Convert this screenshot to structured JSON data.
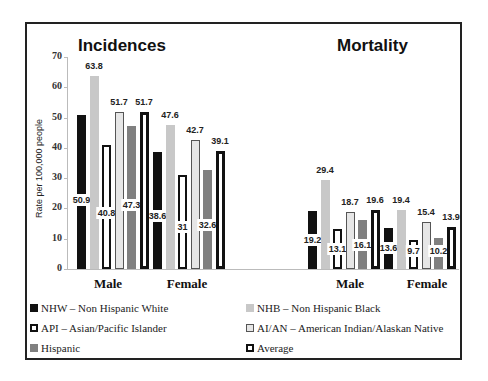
{
  "chart_data": [
    {
      "type": "bar",
      "title": "Incidences",
      "categories": [
        "Male",
        "Female"
      ],
      "series": [
        {
          "name": "NHW – Non Hispanic White",
          "values": [
            50.9,
            38.6
          ]
        },
        {
          "name": "NHB – Non Hispanic Black",
          "values": [
            63.8,
            47.6
          ]
        },
        {
          "name": "API – Asian/Pacific Islander",
          "values": [
            40.8,
            31
          ]
        },
        {
          "name": "AI/AN – American Indian/Alaskan Native",
          "values": [
            51.7,
            42.7
          ]
        },
        {
          "name": "Hispanic",
          "values": [
            47.3,
            32.6
          ]
        },
        {
          "name": "Average",
          "values": [
            51.7,
            39.1
          ]
        }
      ],
      "ylabel": "Rate per 100,000 people",
      "ylim": [
        0,
        70
      ],
      "yticks": [
        0,
        10,
        20,
        30,
        40,
        50,
        60,
        70
      ],
      "grid": false
    },
    {
      "type": "bar",
      "title": "Mortality",
      "categories": [
        "Male",
        "Female"
      ],
      "series": [
        {
          "name": "NHW – Non Hispanic White",
          "values": [
            19.2,
            13.6
          ]
        },
        {
          "name": "NHB – Non Hispanic Black",
          "values": [
            29.4,
            19.4
          ]
        },
        {
          "name": "API – Asian/Pacific Islander",
          "values": [
            13.1,
            9.7
          ]
        },
        {
          "name": "AI/AN – American Indian/Alaskan Native",
          "values": [
            18.7,
            15.4
          ]
        },
        {
          "name": "Hispanic",
          "values": [
            16.1,
            10.2
          ]
        },
        {
          "name": "Average",
          "values": [
            19.6,
            13.9
          ]
        }
      ],
      "ylabel": "Rate per 100,000 people",
      "ylim": [
        0,
        70
      ],
      "grid": false
    }
  ],
  "labels": {
    "incidences_title": "Incidences",
    "mortality_title": "Mortality",
    "ylabel": "Rate per 100,000 people",
    "male": "Male",
    "female": "Female",
    "yticks": [
      "0",
      "10",
      "20",
      "30",
      "40",
      "50",
      "60",
      "70"
    ]
  },
  "legend": {
    "position": "bottom",
    "items": [
      {
        "label": "NHW – Non Hispanic White",
        "style": "solid-black"
      },
      {
        "label": "NHB – Non Hispanic Black",
        "style": "light-gray"
      },
      {
        "label": "API – Asian/Pacific Islander",
        "style": "black-outline"
      },
      {
        "label": "AI/AN – American Indian/Alaskan Native",
        "style": "gray-outline"
      },
      {
        "label": "Hispanic",
        "style": "mid-gray"
      },
      {
        "label": "Average",
        "style": "thick-black-outline"
      }
    ]
  },
  "colors": {
    "nhw": "#111111",
    "nhb": "#c8c8c8",
    "api_border": "#111111",
    "aian_fill": "#e6e6e6",
    "aian_border": "#555555",
    "hispanic": "#808080",
    "avg_border": "#111111"
  }
}
